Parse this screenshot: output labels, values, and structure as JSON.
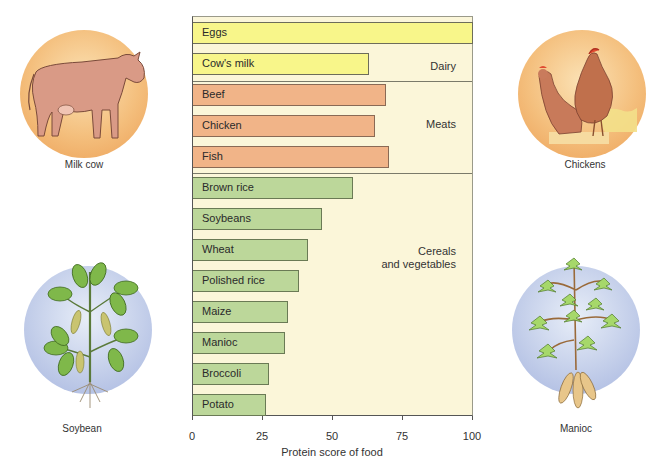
{
  "chart_data": {
    "type": "bar",
    "orientation": "horizontal",
    "title": "",
    "xlabel": "Protein score of food",
    "ylabel": "",
    "xlim": [
      0,
      100
    ],
    "xticks": [
      0,
      25,
      50,
      75,
      100
    ],
    "grid": false,
    "categories": [
      "Eggs",
      "Cow's milk",
      "Beef",
      "Chicken",
      "Fish",
      "Brown rice",
      "Soybeans",
      "Wheat",
      "Polished rice",
      "Maize",
      "Manioc",
      "Broccoli",
      "Potato"
    ],
    "values": [
      100,
      63,
      69,
      65,
      70,
      57,
      46,
      41,
      38,
      34,
      33,
      27,
      26
    ],
    "groups": [
      {
        "name": "Dairy",
        "items": [
          "Eggs",
          "Cow's milk"
        ],
        "color": "#f8f68a"
      },
      {
        "name": "Meats",
        "items": [
          "Beef",
          "Chicken",
          "Fish"
        ],
        "color": "#f1b488"
      },
      {
        "name": "Cereals and vegetables",
        "items": [
          "Brown rice",
          "Soybeans",
          "Wheat",
          "Polished rice",
          "Maize",
          "Manioc",
          "Broccoli",
          "Potato"
        ],
        "color": "#bcd79a"
      }
    ]
  },
  "bars": [
    {
      "label": "Eggs",
      "value": 100,
      "group": "dairy"
    },
    {
      "label": "Cow's milk",
      "value": 63,
      "group": "dairy"
    },
    {
      "label": "Beef",
      "value": 69,
      "group": "meat"
    },
    {
      "label": "Chicken",
      "value": 65,
      "group": "meat"
    },
    {
      "label": "Fish",
      "value": 70,
      "group": "meat"
    },
    {
      "label": "Brown rice",
      "value": 57,
      "group": "cereal"
    },
    {
      "label": "Soybeans",
      "value": 46,
      "group": "cereal"
    },
    {
      "label": "Wheat",
      "value": 41,
      "group": "cereal"
    },
    {
      "label": "Polished rice",
      "value": 38,
      "group": "cereal"
    },
    {
      "label": "Maize",
      "value": 34,
      "group": "cereal"
    },
    {
      "label": "Manioc",
      "value": 33,
      "group": "cereal"
    },
    {
      "label": "Broccoli",
      "value": 27,
      "group": "cereal"
    },
    {
      "label": "Potato",
      "value": 26,
      "group": "cereal"
    }
  ],
  "group_labels": {
    "dairy": "Dairy",
    "meats": "Meats",
    "cereals_line1": "Cereals",
    "cereals_line2": "and vegetables"
  },
  "axis": {
    "ticks": [
      "0",
      "25",
      "50",
      "75",
      "100"
    ],
    "label": "Protein score of food"
  },
  "illustrations": {
    "milk_cow": "Milk cow",
    "chickens": "Chickens",
    "soybean": "Soybean",
    "manioc": "Manioc"
  },
  "colors": {
    "plot_bg": "#fbf6d9",
    "dairy": "#f8f68a",
    "meat": "#f1b488",
    "cereal": "#bcd79a",
    "animal_circle": "#f0b36a",
    "plant_circle": "#b9c6e6"
  }
}
